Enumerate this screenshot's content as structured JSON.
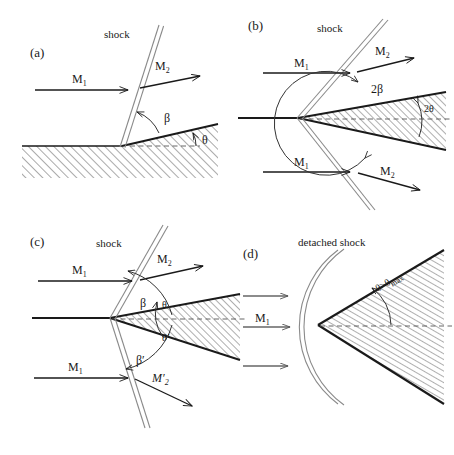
{
  "figure": {
    "type": "diagram",
    "background_color": "#ffffff",
    "line_color": "#1a1a1a",
    "shock_line_color": "#777777",
    "hatch_color": "#333333",
    "dashed_color": "#555555"
  },
  "panels": [
    {
      "id": "a",
      "tag": "(a)",
      "caption": "attached oblique shock on a single-sided ramp",
      "labels": {
        "shock": "shock",
        "mach_in": "M",
        "mach_in_sub": "1",
        "mach_out": "M",
        "mach_out_sub": "2",
        "shock_angle": "β",
        "deflection_angle": "θ"
      }
    },
    {
      "id": "b",
      "tag": "(b)",
      "caption": "symmetric wedge with attached shocks",
      "labels": {
        "shock": "shock",
        "mach_in_top": "M",
        "mach_in_top_sub": "1",
        "mach_out_top": "M",
        "mach_out_top_sub": "2",
        "mach_in_bot": "M",
        "mach_in_bot_sub": "1",
        "mach_out_bot": "M",
        "mach_out_bot_sub": "2",
        "shock_angle": "2β",
        "wedge_angle": "2θ"
      }
    },
    {
      "id": "c",
      "tag": "(c)",
      "caption": "asymmetric wedge at angle of attack",
      "labels": {
        "shock": "shock",
        "mach_in_top": "M",
        "mach_in_top_sub": "1",
        "mach_out_top": "M",
        "mach_out_top_sub": "2",
        "mach_in_bot": "M",
        "mach_in_bot_sub": "1",
        "mach_out_bot": "M′",
        "mach_out_bot_sub": "2",
        "shock_angle_top": "β",
        "shock_angle_bot": "β′",
        "deflection_top": "θ",
        "deflection_bot": "θ′"
      }
    },
    {
      "id": "d",
      "tag": "(d)",
      "caption": "detached bow shock for deflection beyond maximum",
      "labels": {
        "detached_shock": "detached shock",
        "mach_in": "M",
        "mach_in_sub": "1",
        "condition": "θ>θ",
        "condition_sub": "max"
      }
    }
  ]
}
